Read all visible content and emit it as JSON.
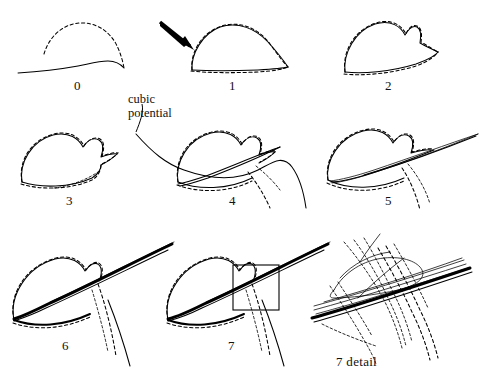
{
  "figure": {
    "background": "#ffffff",
    "ink": "#000000",
    "width": 495,
    "height": 392
  },
  "annotations": {
    "cubic_potential": {
      "line1": "cubic",
      "line2": "potential",
      "x": 128,
      "y": 92
    },
    "arrow": {
      "name": "pointer-arrow",
      "panel": "1",
      "from_x": 160,
      "from_y": 22,
      "to_x": 190,
      "to_y": 48
    },
    "detail_box": {
      "x": 233,
      "y": 265,
      "width": 46,
      "height": 45
    }
  },
  "panels": [
    {
      "id": "0",
      "label": "0",
      "label_x": 74,
      "label_y": 78,
      "ox": 0,
      "oy": 0
    },
    {
      "id": "1",
      "label": "1",
      "label_x": 229,
      "label_y": 78,
      "ox": 160,
      "oy": 0
    },
    {
      "id": "2",
      "label": "2",
      "label_x": 385,
      "label_y": 78,
      "ox": 318,
      "oy": 0
    },
    {
      "id": "3",
      "label": "3",
      "label_x": 66,
      "label_y": 193,
      "ox": 0,
      "oy": 112
    },
    {
      "id": "4",
      "label": "4",
      "label_x": 229,
      "label_y": 193,
      "ox": 160,
      "oy": 112
    },
    {
      "id": "5",
      "label": "5",
      "label_x": 385,
      "label_y": 193,
      "ox": 318,
      "oy": 112
    },
    {
      "id": "6",
      "label": "6",
      "label_x": 62,
      "label_y": 338,
      "ox": 0,
      "oy": 228
    },
    {
      "id": "7",
      "label": "7",
      "label_x": 228,
      "label_y": 338,
      "ox": 160,
      "oy": 228
    },
    {
      "id": "7d",
      "label": "7  detail",
      "label_x": 336,
      "label_y": 354,
      "ox": 318,
      "oy": 228
    }
  ],
  "legend": {
    "solid_meaning": "computed curve",
    "dashed_meaning": "reference curve"
  }
}
